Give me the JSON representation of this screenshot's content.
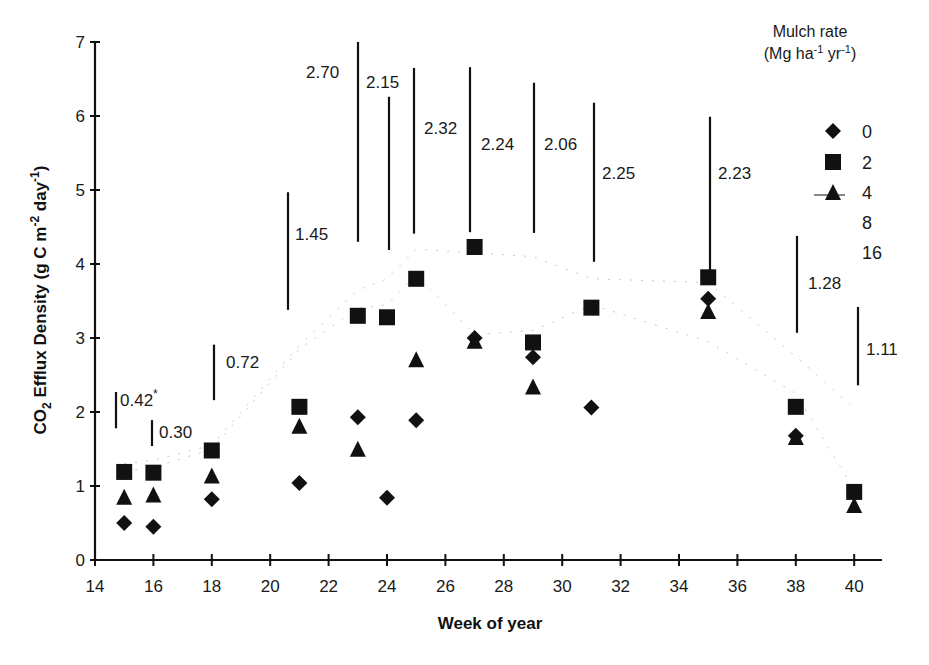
{
  "chart_data": {
    "type": "scatter",
    "title": "",
    "xlabel": "Week of year",
    "ylabel": "CO2 Efflux Density (g C m-2 day-1)",
    "ylabel_parts": {
      "pre": "CO",
      "sub": "2",
      "mid": " Efflux Density (g C m",
      "sup1": "-2",
      "mid2": " day",
      "sup2": "-1",
      "post": ")"
    },
    "xlim": [
      14,
      41
    ],
    "ylim": [
      0,
      7
    ],
    "xticks": [
      14,
      16,
      18,
      20,
      22,
      24,
      26,
      28,
      30,
      32,
      34,
      36,
      38,
      40
    ],
    "yticks": [
      0,
      1,
      2,
      3,
      4,
      5,
      6,
      7
    ],
    "grid": false,
    "legend": {
      "position": "upper right",
      "title_line1": "Mulch rate",
      "title_line2_parts": {
        "pre": "(Mg ha",
        "sup1": "-1",
        "mid": " yr",
        "sup2": "-1",
        "post": ")"
      },
      "entries": [
        {
          "label": "0",
          "marker": "diamond"
        },
        {
          "label": "2",
          "marker": "square"
        },
        {
          "label": "4",
          "marker": "triangle-line"
        },
        {
          "label": "8",
          "marker": "faint"
        },
        {
          "label": "16",
          "marker": "faint"
        }
      ]
    },
    "series": [
      {
        "name": "0",
        "marker": "diamond",
        "x": [
          15,
          16,
          18,
          21,
          23,
          24,
          25,
          27,
          29,
          31,
          35,
          38
        ],
        "values": [
          0.5,
          0.45,
          0.82,
          1.04,
          1.93,
          0.84,
          1.89,
          3.0,
          2.74,
          2.06,
          3.53,
          1.68
        ]
      },
      {
        "name": "2",
        "marker": "square",
        "x": [
          15,
          16,
          18,
          21,
          23,
          24,
          25,
          27,
          29,
          31,
          35,
          38,
          40
        ],
        "values": [
          1.19,
          1.18,
          1.48,
          2.07,
          3.3,
          3.28,
          3.8,
          4.23,
          2.94,
          3.41,
          3.82,
          2.07,
          0.92
        ]
      },
      {
        "name": "4",
        "marker": "triangle",
        "x": [
          15,
          16,
          18,
          21,
          23,
          25,
          27,
          29,
          35,
          38,
          40
        ],
        "values": [
          0.84,
          0.87,
          1.13,
          1.8,
          1.49,
          2.7,
          2.95,
          2.33,
          3.35,
          1.65,
          0.73
        ]
      },
      {
        "name": "8",
        "marker": "faint-line",
        "x": [
          15,
          16,
          18,
          21,
          23,
          24,
          25,
          27,
          29,
          31,
          35,
          38,
          40
        ],
        "values": [
          1.2,
          1.25,
          1.5,
          2.85,
          3.4,
          3.45,
          3.85,
          3.05,
          3.1,
          3.45,
          2.95,
          2.25,
          0.95
        ]
      },
      {
        "name": "16",
        "marker": "faint-line",
        "x": [
          15,
          16,
          18,
          21,
          23,
          24,
          25,
          27,
          29,
          31,
          35,
          38,
          40
        ],
        "values": [
          1.3,
          1.35,
          1.55,
          2.9,
          3.65,
          3.8,
          4.2,
          4.15,
          4.1,
          3.8,
          3.75,
          2.75,
          2.05
        ]
      }
    ],
    "lsd_bars": [
      {
        "week": 15,
        "value": "0.42",
        "note": "*",
        "y_top": 2.27,
        "y_bottom": 1.78
      },
      {
        "week": 16,
        "value": "0.30",
        "y_top": 1.89,
        "y_bottom": 1.54
      },
      {
        "week": 18,
        "value": "0.72",
        "y_top": 2.91,
        "y_bottom": 2.16
      },
      {
        "week": 21,
        "value": "1.45",
        "y_top": 4.97,
        "y_bottom": 3.38
      },
      {
        "week": 23,
        "value": "2.70",
        "y_top": 7.0,
        "y_bottom": 4.3
      },
      {
        "week": 24,
        "value": "2.15",
        "y_top": 6.26,
        "y_bottom": 4.19
      },
      {
        "week": 25,
        "value": "2.32",
        "y_top": 6.65,
        "y_bottom": 4.41
      },
      {
        "week": 27,
        "value": "2.24",
        "y_top": 6.66,
        "y_bottom": 4.43
      },
      {
        "week": 29,
        "value": "2.06",
        "y_top": 6.45,
        "y_bottom": 4.42
      },
      {
        "week": 31,
        "value": "2.25",
        "y_top": 6.18,
        "y_bottom": 4.03
      },
      {
        "week": 35,
        "value": "2.23",
        "y_top": 5.99,
        "y_bottom": 3.82
      },
      {
        "week": 38,
        "value": "1.28",
        "y_top": 4.38,
        "y_bottom": 3.07
      },
      {
        "week": 40,
        "value": "1.11",
        "y_top": 3.42,
        "y_bottom": 2.36
      }
    ]
  },
  "labels": {
    "xlabel": "Week of year",
    "legend_title_line1": "Mulch rate",
    "legend_entries": [
      "0",
      "2",
      "4",
      "8",
      "16"
    ],
    "lsd": [
      "0.42",
      "0.30",
      "0.72",
      "1.45",
      "2.70",
      "2.15",
      "2.32",
      "2.24",
      "2.06",
      "2.25",
      "2.23",
      "1.28",
      "1.11"
    ],
    "lsd_note": "*"
  },
  "colors": {
    "ink": "#111111",
    "faint": "#c8c8c8",
    "background": "#ffffff"
  }
}
